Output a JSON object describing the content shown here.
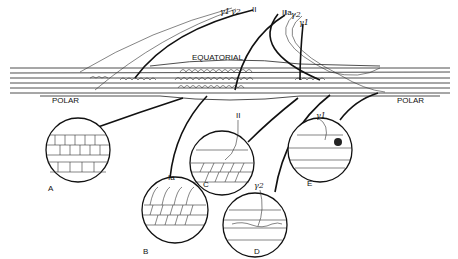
{
  "diagram": {
    "region_labels": {
      "equatorial": "EQUATORIAL",
      "polar_left": "POLAR",
      "polar_right": "POLAR"
    },
    "fiber_labels_top": [
      {
        "id": "gamma1_left",
        "text": "γ1"
      },
      {
        "id": "gamma2_left",
        "text": "γ2"
      },
      {
        "id": "II_left",
        "text": "II"
      },
      {
        "id": "Ia",
        "text": "Ia"
      },
      {
        "id": "II_right",
        "text": "II"
      },
      {
        "id": "gamma2_right",
        "text": "γ2"
      },
      {
        "id": "gamma1_right",
        "text": "γ1"
      }
    ],
    "insets": [
      {
        "id": "A",
        "label": "A",
        "fiber_label": ""
      },
      {
        "id": "B",
        "label": "B",
        "fiber_label": "Ia"
      },
      {
        "id": "C",
        "label": "C",
        "fiber_label": "II"
      },
      {
        "id": "D",
        "label": "D",
        "fiber_label": "γ2"
      },
      {
        "id": "E",
        "label": "E",
        "fiber_label": "γ1"
      }
    ]
  }
}
